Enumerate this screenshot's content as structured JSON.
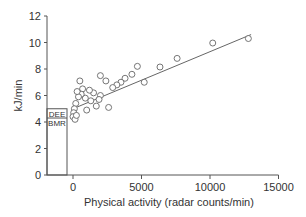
{
  "chart_data": {
    "type": "scatter",
    "title": "",
    "xlabel": "Physical activity (radar counts/min)",
    "ylabel": "kJ/min",
    "xlim": [
      -1500,
      15000
    ],
    "ylim": [
      0,
      12
    ],
    "x_ticks": [
      "0",
      "5000",
      "10000",
      "15000"
    ],
    "y_ticks": [
      "0",
      "2",
      "4",
      "6",
      "8",
      "10",
      "12"
    ],
    "grid": false,
    "legend": null,
    "bar_annotations": [
      {
        "label": "DEE",
        "value": 5.0
      },
      {
        "label": "BMR",
        "value": 4.3
      }
    ],
    "regression_line": {
      "x": [
        0,
        13000
      ],
      "y": [
        5.0,
        10.6
      ]
    },
    "points": [
      {
        "x": 12800,
        "y": 10.3
      },
      {
        "x": 10200,
        "y": 9.96
      },
      {
        "x": 7600,
        "y": 8.8
      },
      {
        "x": 6350,
        "y": 8.15
      },
      {
        "x": 5200,
        "y": 7.0
      },
      {
        "x": 4700,
        "y": 8.2
      },
      {
        "x": 4300,
        "y": 7.6
      },
      {
        "x": 3800,
        "y": 7.3
      },
      {
        "x": 3500,
        "y": 7.0
      },
      {
        "x": 3200,
        "y": 6.8
      },
      {
        "x": 2900,
        "y": 6.6
      },
      {
        "x": 2400,
        "y": 7.1
      },
      {
        "x": 2000,
        "y": 7.5
      },
      {
        "x": 2000,
        "y": 6.0
      },
      {
        "x": 1900,
        "y": 5.7
      },
      {
        "x": 1700,
        "y": 5.2
      },
      {
        "x": 1500,
        "y": 6.2
      },
      {
        "x": 1200,
        "y": 6.4
      },
      {
        "x": 1000,
        "y": 4.9
      },
      {
        "x": 900,
        "y": 5.8
      },
      {
        "x": 700,
        "y": 6.5
      },
      {
        "x": 600,
        "y": 6.1
      },
      {
        "x": 500,
        "y": 7.1
      },
      {
        "x": 400,
        "y": 5.9
      },
      {
        "x": 300,
        "y": 6.3
      },
      {
        "x": 200,
        "y": 5.4
      },
      {
        "x": 100,
        "y": 5.0
      },
      {
        "x": 50,
        "y": 4.7
      },
      {
        "x": 0,
        "y": 4.4
      },
      {
        "x": 150,
        "y": 4.2
      },
      {
        "x": 250,
        "y": 4.5
      },
      {
        "x": 1300,
        "y": 5.6
      },
      {
        "x": 2600,
        "y": 5.1
      }
    ]
  }
}
